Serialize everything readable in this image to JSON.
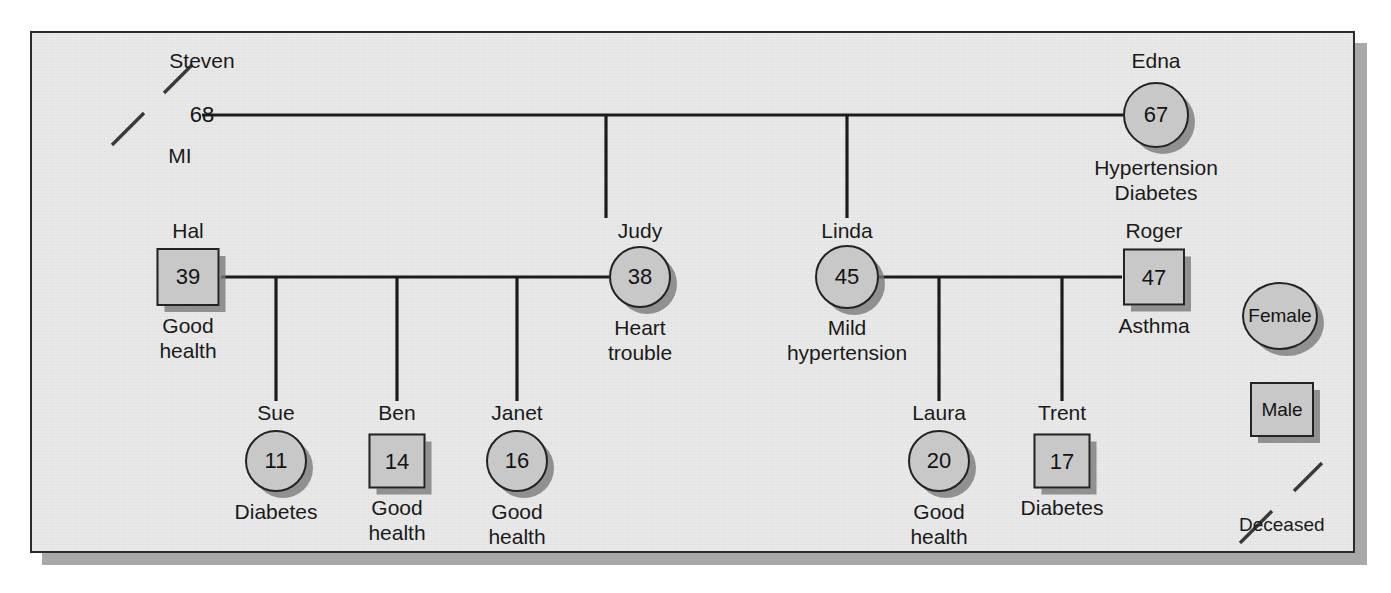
{
  "diagram": {
    "type": "genogram",
    "background_color": "#e9e9e9",
    "node_fill_color": "#c8c8c8",
    "line_color": "#1c1c1c",
    "border_color": "#2b2b2b"
  },
  "people": [
    {
      "id": "steven",
      "name": "Steven",
      "age": "68",
      "note": "MI",
      "sex": "male",
      "deceased": true
    },
    {
      "id": "edna",
      "name": "Edna",
      "age": "67",
      "note": "Hypertension\nDiabetes",
      "sex": "female",
      "deceased": false
    },
    {
      "id": "hal",
      "name": "Hal",
      "age": "39",
      "note": "Good\nhealth",
      "sex": "male",
      "deceased": false
    },
    {
      "id": "judy",
      "name": "Judy",
      "age": "38",
      "note": "Heart\ntrouble",
      "sex": "female",
      "deceased": false
    },
    {
      "id": "linda",
      "name": "Linda",
      "age": "45",
      "note": "Mild\nhypertension",
      "sex": "female",
      "deceased": false
    },
    {
      "id": "roger",
      "name": "Roger",
      "age": "47",
      "note": "Asthma",
      "sex": "male",
      "deceased": false
    },
    {
      "id": "sue",
      "name": "Sue",
      "age": "11",
      "note": "Diabetes",
      "sex": "female",
      "deceased": false
    },
    {
      "id": "ben",
      "name": "Ben",
      "age": "14",
      "note": "Good\nhealth",
      "sex": "male",
      "deceased": false
    },
    {
      "id": "janet",
      "name": "Janet",
      "age": "16",
      "note": "Good\nhealth",
      "sex": "female",
      "deceased": false
    },
    {
      "id": "laura",
      "name": "Laura",
      "age": "20",
      "note": "Good\nhealth",
      "sex": "female",
      "deceased": false
    },
    {
      "id": "trent",
      "name": "Trent",
      "age": "17",
      "note": "Diabetes",
      "sex": "male",
      "deceased": false
    }
  ],
  "legend": {
    "female_label": "Female",
    "male_label": "Male",
    "deceased_label": "Deceased"
  }
}
